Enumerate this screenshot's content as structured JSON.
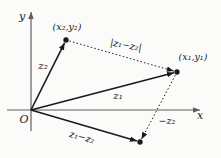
{
  "colors": {
    "background": "#fbfbf9",
    "ink": "#1a1a1a",
    "axis": "#5f5f5f"
  },
  "axes": {
    "x_label": "x",
    "y_label": "y",
    "origin_label": "O"
  },
  "points": {
    "p2_label": "(x₂,y₂)",
    "p1_label": "(x₁,y₁)"
  },
  "vectors": {
    "z2": "z₂",
    "z1": "z₁",
    "z1_minus_z2": "z₁−z₂",
    "neg_z2": "−z₂",
    "abs_z1_minus_z2": "|z₁−z₂|"
  }
}
